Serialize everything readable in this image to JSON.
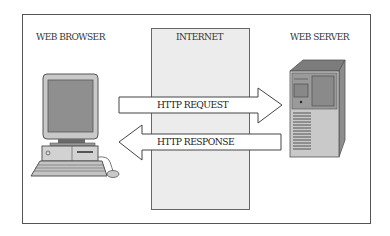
{
  "diagram": {
    "labels": {
      "client": "WEB BROWSER",
      "network": "INTERNET",
      "server": "WEB SERVER"
    },
    "arrows": {
      "request": "HTTP REQUEST",
      "response": "HTTP RESPONSE"
    },
    "colors": {
      "frame": "#555555",
      "internet_fill": "#ececec",
      "device_dark": "#8a8a8a",
      "device_light": "#c8c8c8"
    }
  }
}
